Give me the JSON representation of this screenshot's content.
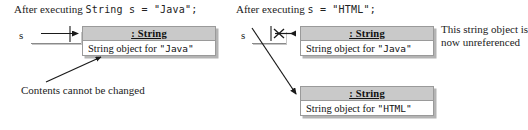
{
  "diagram": {
    "title_left": "After executing String s = \"Java\";",
    "title_right": "After executing s = \"HTML\";",
    "left": {
      "caption_prefix": "After executing ",
      "caption_code": "String s = \"Java\";",
      "variable_label": "s",
      "object": {
        "header": ": String",
        "body_prefix": "String object for ",
        "body_literal": "\"Java\""
      },
      "annotation": "Contents cannot be changed"
    },
    "right": {
      "caption_prefix": "After executing ",
      "caption_code": "s = \"HTML\";",
      "variable_label": "s",
      "object_old": {
        "header": ": String",
        "body_prefix": "String object for ",
        "body_literal": "\"Java\""
      },
      "object_new": {
        "header": ": String",
        "body_prefix": "String object for ",
        "body_literal": "\"HTML\""
      },
      "annotation_line1": "This string object is",
      "annotation_line2": "now unreferenced",
      "broken_link_marker": "x-cross-mark"
    },
    "colors": {
      "header_fill": "#c9c9c9",
      "border": "#9a9a9a",
      "shadow": "#b4b4b4",
      "ink": "#1a1a1a",
      "page": "#ffffff"
    }
  }
}
